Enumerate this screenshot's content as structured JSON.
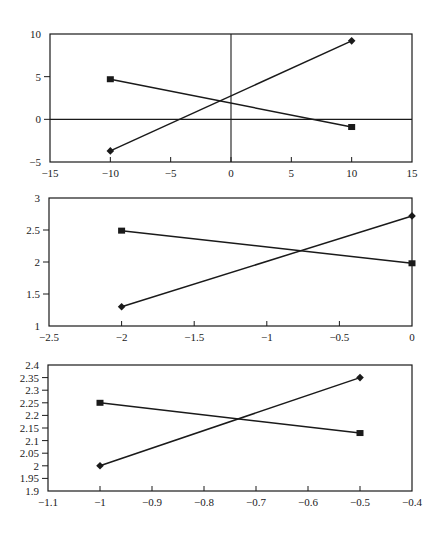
{
  "chart_data": [
    {
      "type": "line",
      "title": "",
      "xlabel": "",
      "ylabel": "",
      "xlim": [
        -15,
        15
      ],
      "ylim": [
        -5,
        10
      ],
      "xticks": [
        -15,
        -10,
        -5,
        0,
        5,
        10,
        15
      ],
      "yticks": [
        -5,
        0,
        5,
        10
      ],
      "xtick_labels": [
        "-15",
        "-10",
        "-5",
        "0",
        "5",
        "10",
        "15"
      ],
      "ytick_labels": [
        "-5",
        "0",
        "5",
        "10"
      ],
      "zero_lines": true,
      "grid": false,
      "legend": null,
      "series": [
        {
          "name": "diamond-series",
          "marker": "diamond",
          "x": [
            -10,
            10
          ],
          "values": [
            -3.7,
            9.2
          ]
        },
        {
          "name": "square-series",
          "marker": "square",
          "x": [
            -10,
            10
          ],
          "values": [
            4.7,
            -0.9
          ]
        }
      ]
    },
    {
      "type": "line",
      "title": "",
      "xlabel": "",
      "ylabel": "",
      "xlim": [
        -2.5,
        0
      ],
      "ylim": [
        1,
        3
      ],
      "xticks": [
        -2.5,
        -2,
        -1.5,
        -1,
        -0.5,
        0
      ],
      "yticks": [
        1,
        1.5,
        2,
        2.5,
        3
      ],
      "xtick_labels": [
        "-2.5",
        "-2",
        "-1.5",
        "-1",
        "-0.5",
        "0"
      ],
      "ytick_labels": [
        "1",
        "1.5",
        "2",
        "2.5",
        "3"
      ],
      "zero_lines": false,
      "grid": false,
      "legend": null,
      "series": [
        {
          "name": "diamond-series",
          "marker": "diamond",
          "x": [
            -2,
            0
          ],
          "values": [
            1.3,
            2.72
          ]
        },
        {
          "name": "square-series",
          "marker": "square",
          "x": [
            -2,
            0
          ],
          "values": [
            2.49,
            1.98
          ]
        }
      ]
    },
    {
      "type": "line",
      "title": "",
      "xlabel": "",
      "ylabel": "",
      "xlim": [
        -1.1,
        -0.4
      ],
      "ylim": [
        1.9,
        2.4
      ],
      "xticks": [
        -1.1,
        -1,
        -0.9,
        -0.8,
        -0.7,
        -0.6,
        -0.5,
        -0.4
      ],
      "yticks": [
        1.9,
        1.95,
        2,
        2.05,
        2.1,
        2.15,
        2.2,
        2.25,
        2.3,
        2.35,
        2.4
      ],
      "xtick_labels": [
        "-1.1",
        "-1",
        "-0.9",
        "-0.8",
        "-0.7",
        "-0.6",
        "-0.5",
        "-0.4"
      ],
      "ytick_labels": [
        "1.9",
        "1.95",
        "2",
        "2.05",
        "2.1",
        "2.15",
        "2.2",
        "2.25",
        "2.3",
        "2.35",
        "2.4"
      ],
      "zero_lines": false,
      "grid": false,
      "legend": null,
      "series": [
        {
          "name": "diamond-series",
          "marker": "diamond",
          "x": [
            -1,
            -0.5
          ],
          "values": [
            2.0,
            2.35
          ]
        },
        {
          "name": "square-series",
          "marker": "square",
          "x": [
            -1,
            -0.5
          ],
          "values": [
            2.25,
            2.13
          ]
        }
      ]
    }
  ],
  "style": {
    "line_color": "#1a1a1a",
    "axis_color": "#1a1a1a",
    "background": "#ffffff"
  }
}
